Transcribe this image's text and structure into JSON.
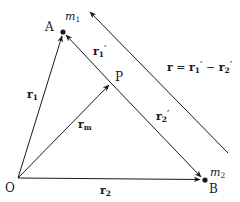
{
  "diagram": {
    "colors": {
      "line": "#1a1a1a",
      "background": "#ffffff"
    },
    "points": {
      "O": {
        "label": "O",
        "x": 18,
        "y": 178
      },
      "A": {
        "label": "A",
        "x": 63,
        "y": 32,
        "mass": "m",
        "mass_sub": "1"
      },
      "B": {
        "label": "B",
        "x": 204,
        "y": 180,
        "mass": "m",
        "mass_sub": "2"
      },
      "P": {
        "label": "P",
        "x": 111,
        "y": 83
      }
    },
    "vectors": {
      "r1": {
        "base": "r",
        "sub": "1",
        "prime": "",
        "from": "O",
        "to": "A"
      },
      "r2": {
        "base": "r",
        "sub": "2",
        "prime": "",
        "from": "O",
        "to": "B"
      },
      "rm": {
        "base": "r",
        "sub": "m",
        "prime": "",
        "from": "O",
        "to": "P"
      },
      "r1p": {
        "base": "r",
        "sub": "1",
        "prime": "′",
        "from": "P",
        "to": "A"
      },
      "r2p": {
        "base": "r",
        "sub": "2",
        "prime": "′",
        "from": "P",
        "to": "B"
      },
      "r": {
        "base": "r",
        "sub": "",
        "prime": "",
        "from": "lower-right",
        "to": "upper-left",
        "note": "parallel to AB"
      }
    },
    "equation": {
      "lhs": "r",
      "eq": " = ",
      "t1_base": "r",
      "t1_sub": "1",
      "t1_prime": "′",
      "op": " − ",
      "t2_base": "r",
      "t2_sub": "2",
      "t2_prime": "′"
    }
  }
}
